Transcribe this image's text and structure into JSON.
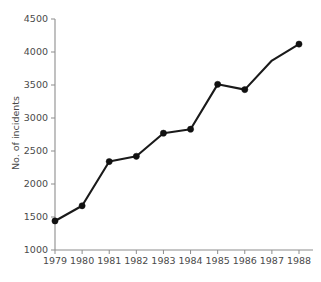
{
  "chart_data": {
    "type": "line",
    "title": "",
    "xlabel": "",
    "ylabel": "No. of incidents",
    "categories": [
      "1979",
      "1980",
      "1981",
      "1982",
      "1983",
      "1984",
      "1985",
      "1986",
      "1987",
      "1988"
    ],
    "x": [
      1979,
      1980,
      1981,
      1982,
      1983,
      1984,
      1985,
      1986,
      1987,
      1988
    ],
    "values": [
      1440,
      1670,
      2340,
      2420,
      2770,
      2830,
      3510,
      3430,
      3870,
      4120
    ],
    "series": [
      {
        "name": "No. of incidents",
        "values": [
          1440,
          1670,
          2340,
          2420,
          2770,
          2830,
          3510,
          3430,
          3870,
          4120
        ]
      }
    ],
    "ylim": [
      1000,
      4500
    ],
    "yticks": [
      1000,
      1500,
      2000,
      2500,
      3000,
      3500,
      4000,
      4500
    ],
    "ytick_labels": [
      "1000",
      "1500",
      "2000",
      "2500",
      "3000",
      "3500",
      "4000",
      "4500"
    ],
    "xtick_labels": [
      "1979",
      "1980",
      "1981",
      "1982",
      "1983",
      "1984",
      "1985",
      "1986",
      "1987",
      "1988"
    ],
    "markers": [
      true,
      true,
      true,
      true,
      true,
      true,
      true,
      true,
      false,
      true
    ],
    "grid": false,
    "legend": false,
    "line_color": "#1a1a1a",
    "marker_color": "#111111",
    "axis_color": "#8d8d8d",
    "text_color": "#4a4a4a",
    "background_color": "#ffffff"
  }
}
